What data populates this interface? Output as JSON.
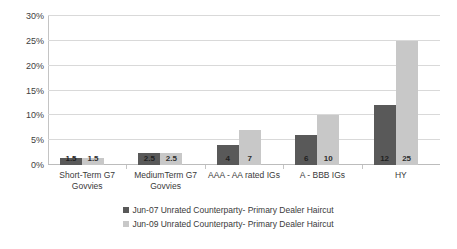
{
  "chart_data": {
    "type": "bar",
    "title": "",
    "xlabel": "",
    "ylabel": "",
    "categories": [
      "Short-Term G7 Govvies",
      "MediumTerm G7 Govvies",
      "AAA - AA rated IGs",
      "A - BBB IGs",
      "HY"
    ],
    "category_lines": [
      [
        "Short-Term G7",
        "Govvies"
      ],
      [
        "MediumTerm G7",
        "Govvies"
      ],
      [
        "AAA - AA rated IGs"
      ],
      [
        "A - BBB IGs"
      ],
      [
        "HY"
      ]
    ],
    "series": [
      {
        "name": "Jun-07 Unrated Counterparty- Primary Dealer Haircut",
        "color": "#595959",
        "values": [
          1.5,
          2.5,
          4,
          6,
          12
        ],
        "labels": [
          "1.5",
          "2.5",
          "4",
          "6",
          "12"
        ]
      },
      {
        "name": "Jun-09 Unrated Counterparty- Primary Dealer Haircut",
        "color": "#c8c8c8",
        "values": [
          1.5,
          2.5,
          7,
          10,
          25
        ],
        "labels": [
          "1.5",
          "2.5",
          "7",
          "10",
          "25"
        ]
      }
    ],
    "ylim": [
      0,
      30
    ],
    "ytick_values": [
      0,
      5,
      10,
      15,
      20,
      25,
      30
    ],
    "ytick_labels": [
      "0%",
      "5%",
      "10%",
      "15%",
      "20%",
      "25%",
      "30%"
    ],
    "grid": true,
    "legend_position": "bottom",
    "gridline_color": "#d9d9d9",
    "axis_color": "#c4c4c4",
    "background": "#ffffff"
  }
}
